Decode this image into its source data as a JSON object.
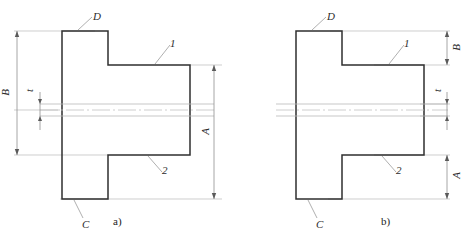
{
  "figure": {
    "colors": {
      "outline": "#2f2f2f",
      "thin_line": "#b9b9b9",
      "center_line": "#c2c2c2",
      "text": "#272727"
    }
  },
  "figure_a": {
    "caption": "a)",
    "labels": {
      "D": "D",
      "one": "1",
      "two": "2",
      "C": "C",
      "B": "B",
      "t": "t",
      "A": "A"
    }
  },
  "figure_b": {
    "caption": "b)",
    "labels": {
      "D": "D",
      "one": "1",
      "two": "2",
      "C": "C",
      "B": "B",
      "t": "t",
      "A": "A"
    }
  }
}
